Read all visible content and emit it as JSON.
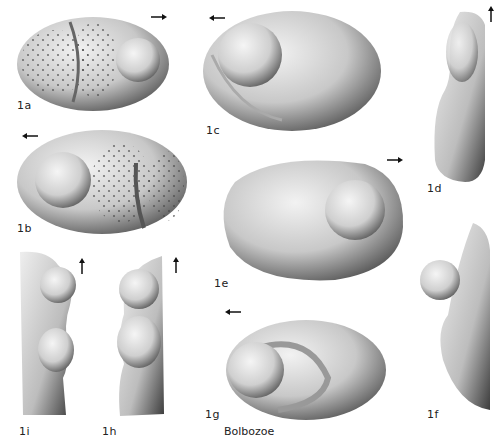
{
  "plate": {
    "caption": "Bolbozoe",
    "figures": [
      {
        "id": "1a",
        "label": "1a",
        "view": "lateral-right",
        "arrow": "right"
      },
      {
        "id": "1b",
        "label": "1b",
        "view": "lateral-left",
        "arrow": "left"
      },
      {
        "id": "1c",
        "label": "1c",
        "view": "lateral-left",
        "arrow": "left"
      },
      {
        "id": "1d",
        "label": "1d",
        "view": "dorsal",
        "arrow": "up"
      },
      {
        "id": "1e",
        "label": "1e",
        "view": "lateral-right",
        "arrow": "right"
      },
      {
        "id": "1f",
        "label": "1f",
        "view": "dorsal",
        "arrow": "up"
      },
      {
        "id": "1g",
        "label": "1g",
        "view": "oblique-anterior",
        "arrow": "left"
      },
      {
        "id": "1h",
        "label": "1h",
        "view": "end",
        "arrow": "up"
      },
      {
        "id": "1i",
        "label": "1i",
        "view": "end",
        "arrow": "up"
      }
    ]
  },
  "colors": {
    "background": "#ffffff",
    "shell_light": "#e8e8e8",
    "shell_dark": "#4a4a4a",
    "text": "#222222"
  }
}
